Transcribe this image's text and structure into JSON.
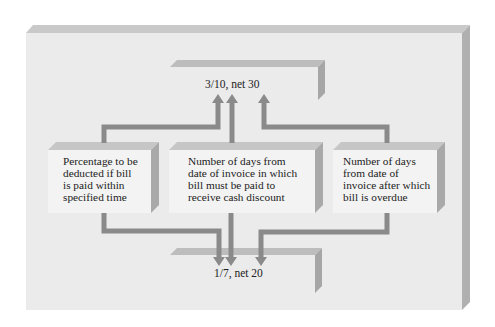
{
  "diagram": {
    "colors": {
      "background": "#ffffff",
      "panel_face": "#ececec",
      "panel_bevel": "#c4c4c4",
      "panel_side": "#a9a9a9",
      "box_face": "#f2f2f2",
      "arrow": "#8a8a8a",
      "text": "#222222"
    },
    "top_term": "3/10, net 30",
    "bottom_term": "1/7, net 20",
    "boxes": [
      {
        "id": "percentage",
        "lines": [
          "Percentage to be",
          "deducted if bill",
          "is paid within",
          "specified time"
        ]
      },
      {
        "id": "discount-days",
        "lines": [
          "Number of days from",
          "date of invoice in which",
          "bill must be paid to",
          "receive cash discount"
        ]
      },
      {
        "id": "net-days",
        "lines": [
          "Number of days",
          "from date of",
          "invoice after which",
          "bill is overdue"
        ]
      }
    ]
  }
}
